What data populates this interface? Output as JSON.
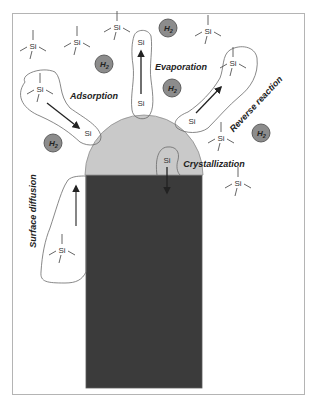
{
  "diagram": {
    "processes": {
      "adsorption": "Adsorption",
      "evaporation": "Evaporation",
      "reverse_reaction": "Reverse reaction",
      "crystallization": "Crystallization",
      "surface_diffusion": "Surface diffusion"
    },
    "species": {
      "silicon": "Si",
      "hydrogen_symbol": "H",
      "hydrogen_subscript": "2"
    },
    "molecules": [
      {
        "label": "Si"
      },
      {
        "label": "Si"
      },
      {
        "label": "Si"
      },
      {
        "label": "Si"
      },
      {
        "label": "Si"
      },
      {
        "label": "Si"
      },
      {
        "label": "Si"
      },
      {
        "label": "Si"
      },
      {
        "label": "Si"
      }
    ],
    "atoms": [
      {
        "label": "Si"
      },
      {
        "label": "Si"
      },
      {
        "label": "Si"
      },
      {
        "label": "Si"
      },
      {
        "label": "Si"
      }
    ],
    "h2_molecules": [
      {
        "symbol": "H",
        "sub": "2"
      },
      {
        "symbol": "H",
        "sub": "2"
      },
      {
        "symbol": "H",
        "sub": "2"
      },
      {
        "symbol": "H",
        "sub": "2"
      },
      {
        "symbol": "H",
        "sub": "2"
      }
    ],
    "colors": {
      "droplet": "#c9c9c9",
      "nanowire": "#3b3b3b",
      "h2": "#8c8c8c"
    }
  }
}
